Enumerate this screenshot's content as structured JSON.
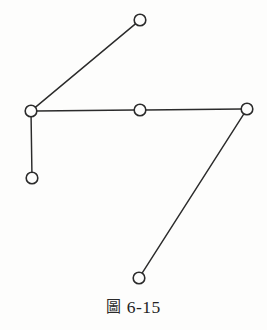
{
  "figure": {
    "caption_label": "圖",
    "caption_number": "6-15",
    "caption_full": "圖 6-15",
    "background_color": "#fdfdfc",
    "ink_color": "#2b2b2b"
  },
  "chart_data": {
    "type": "scatter",
    "xlabel": "",
    "ylabel": "",
    "xlim": [
      0,
      267
    ],
    "ylim": [
      0,
      296
    ],
    "grid": false,
    "legend": null,
    "node_radius": 5.8,
    "nodes": [
      {
        "id": "A",
        "x": 31,
        "y": 111,
        "degree": 3,
        "label": ""
      },
      {
        "id": "B",
        "x": 140,
        "y": 20,
        "degree": 1,
        "label": ""
      },
      {
        "id": "C",
        "x": 140,
        "y": 110,
        "degree": 2,
        "label": ""
      },
      {
        "id": "D",
        "x": 247,
        "y": 109,
        "degree": 2,
        "label": ""
      },
      {
        "id": "E",
        "x": 32,
        "y": 178,
        "degree": 1,
        "label": ""
      },
      {
        "id": "F",
        "x": 139,
        "y": 278,
        "degree": 1,
        "label": ""
      }
    ],
    "edges": [
      {
        "from": "A",
        "to": "B",
        "x1": 31,
        "y1": 111,
        "x2": 140,
        "y2": 20
      },
      {
        "from": "A",
        "to": "C",
        "x1": 31,
        "y1": 111,
        "x2": 140,
        "y2": 110
      },
      {
        "from": "A",
        "to": "E",
        "x1": 31,
        "y1": 111,
        "x2": 32,
        "y2": 178
      },
      {
        "from": "C",
        "to": "D",
        "x1": 140,
        "y1": 110,
        "x2": 247,
        "y2": 109
      },
      {
        "from": "D",
        "to": "F",
        "x1": 247,
        "y1": 109,
        "x2": 139,
        "y2": 278
      }
    ],
    "node_count": 6,
    "edge_count": 5
  }
}
